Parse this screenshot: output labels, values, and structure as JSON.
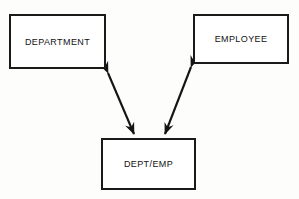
{
  "diagram": {
    "background_color": "#fdfdfc",
    "line_color": "#141414",
    "text_color": "#121212",
    "entities": [
      {
        "id": "department",
        "label": "DEPARTMENT",
        "position": "top-left"
      },
      {
        "id": "employee",
        "label": "EMPLOYEE",
        "position": "top-right"
      },
      {
        "id": "dept_emp",
        "label": "DEPT/EMP",
        "position": "bottom-center"
      }
    ],
    "connectors": [
      {
        "id": "department-to-deptemp",
        "from": "department",
        "to": "dept_emp",
        "style": "double-headed-arrow"
      },
      {
        "id": "employee-to-deptemp",
        "from": "employee",
        "to": "dept_emp",
        "style": "double-headed-arrow"
      }
    ]
  }
}
